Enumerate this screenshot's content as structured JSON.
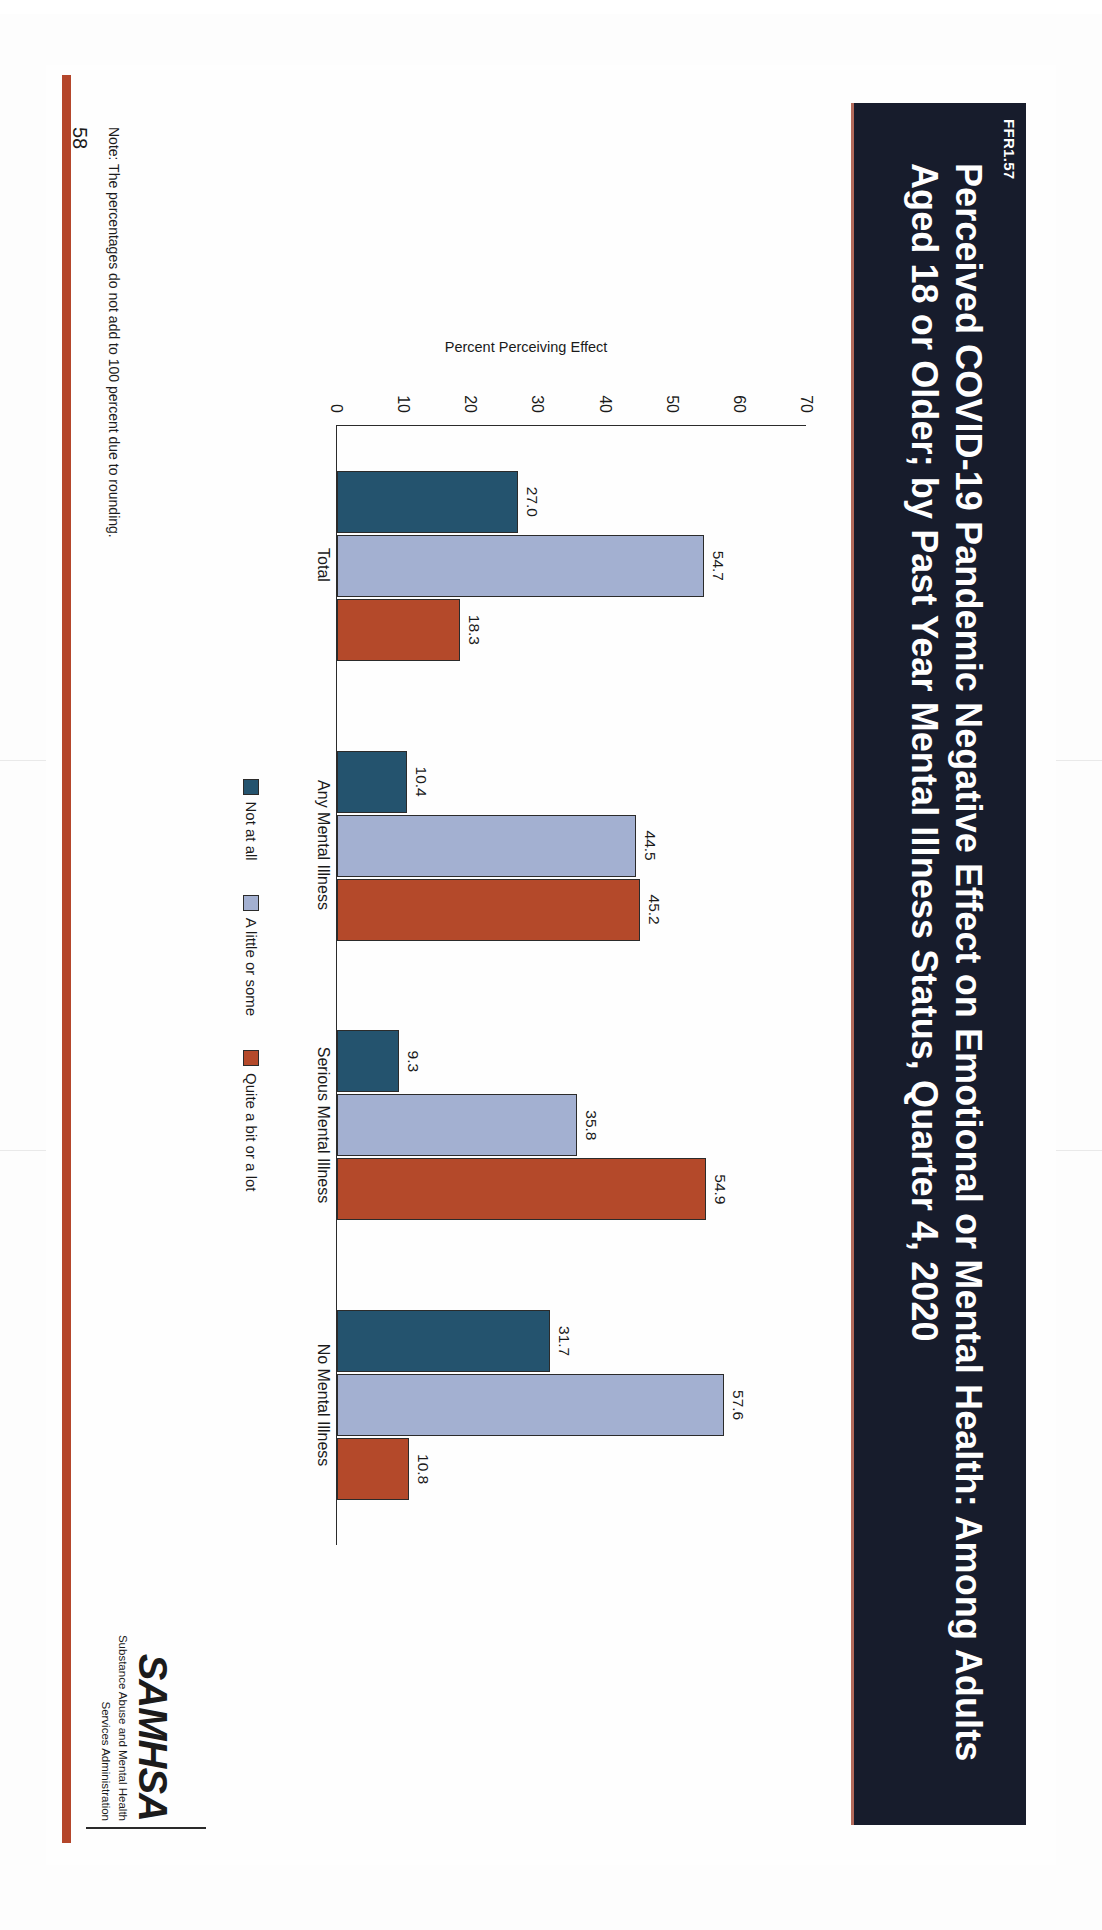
{
  "document": {
    "figure_id": "FFR1.57",
    "page_number": "58",
    "note": "Note: The percentages do not add to 100 percent due to rounding.",
    "title": "Perceived COVID-19 Pandemic Negative Effect on Emotional or Mental Health: Among Adults Aged 18 or Older; by Past Year Mental Illness Status, Quarter 4, 2020"
  },
  "logo": {
    "mark": "SAMHSA",
    "line1": "Substance Abuse and Mental Health",
    "line2": "Services Administration"
  },
  "chart_data": {
    "type": "bar",
    "title": "Perceived COVID-19 Pandemic Negative Effect on Emotional or Mental Health: Among Adults Aged 18 or Older; by Past Year Mental Illness Status, Quarter 4, 2020",
    "xlabel": "",
    "ylabel": "Percent Perceiving Effect",
    "ylim": [
      0,
      70
    ],
    "yticks": [
      "70",
      "60",
      "50",
      "40",
      "30",
      "20",
      "10",
      "0"
    ],
    "grid": false,
    "legend_position": "bottom",
    "categories": [
      "Total",
      "Any Mental Illness",
      "Serious Mental Illness",
      "No Mental Illness"
    ],
    "series": [
      {
        "name": "Not at all",
        "color": "#24536e",
        "values": [
          27.0,
          10.4,
          9.3,
          31.7
        ],
        "labels": [
          "27.0",
          "10.4",
          "9.3",
          "31.7"
        ]
      },
      {
        "name": "A little or some",
        "color": "#a3b0d1",
        "values": [
          54.7,
          44.5,
          35.8,
          57.6
        ],
        "labels": [
          "54.7",
          "44.5",
          "35.8",
          "57.6"
        ]
      },
      {
        "name": "Quite a bit or a lot",
        "color": "#b4492a",
        "values": [
          18.3,
          45.2,
          54.9,
          10.8
        ],
        "labels": [
          "18.3",
          "45.2",
          "54.9",
          "10.8"
        ]
      }
    ]
  },
  "colors": {
    "band": "#171c2c",
    "accent_red": "#b4462b",
    "series_dark_blue": "#24536e",
    "series_light_blue": "#a3b0d1",
    "series_orange": "#b4492a"
  }
}
